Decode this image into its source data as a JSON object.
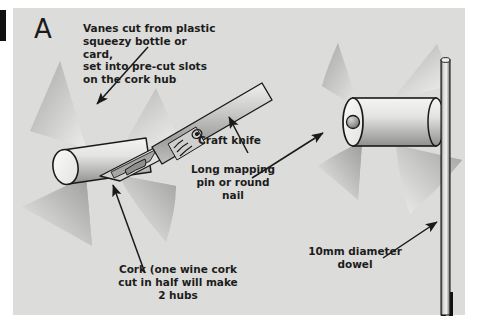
{
  "figure": {
    "panel_letter": "A",
    "background_color": "#dcdcda",
    "page_color": "#ffffff",
    "ink_color": "#1c1c1c"
  },
  "annotations": {
    "vanes": {
      "text": "Vanes cut from plastic\nsqueezy bottle or card,\nset into pre-cut slots\non the cork hub",
      "align": "left"
    },
    "craft_knife": {
      "text": "Craft knife",
      "align": "left"
    },
    "mapping_pin": {
      "text": "Long mapping\npin or round\nnail",
      "align": "center"
    },
    "cork": {
      "text": "Cork (one wine cork\ncut in half will make\n2 hubs",
      "align": "center"
    },
    "dowel": {
      "text": "10mm diameter\ndowel",
      "align": "center"
    }
  },
  "objects": {
    "left_assembly": {
      "name": "cork hub being slotted with craft knife",
      "vane_count": 4
    },
    "right_assembly": {
      "name": "finished windmill rotor on dowel",
      "vane_count": 4
    },
    "dowel": {
      "name": "vertical 10mm dowel"
    },
    "pin": {
      "name": "mapping pin head at rotor centre"
    }
  },
  "palette": {
    "panel": "#dcdcda",
    "vane_light": "#e7e7e5",
    "vane_mid": "#b9b9b7",
    "vane_dark": "#9a9a98",
    "cork_light": "#f2f2f0",
    "cork_mid": "#cfcfcd",
    "cork_shadow": "#9d9d9b",
    "outline": "#1a1a1a",
    "knife_blade": "#e3e3e1",
    "knife_handle_light": "#d6d6d4",
    "knife_handle_dark": "#9c9c9a",
    "dowel_light": "#e9e9e7",
    "dowel_dark": "#6f6f6d"
  }
}
